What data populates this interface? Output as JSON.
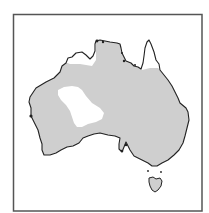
{
  "map": {
    "title": "",
    "region": "Australia",
    "description": "Distribution range map of Australia; shaded area indicates range, white areas are outside range",
    "colors": {
      "background": "#ffffff",
      "frame": "#555555",
      "coastline": "#222222",
      "range_fill": "#cfcfcf",
      "excluded_fill": "#ffffff"
    },
    "frame": {
      "x": 13.5,
      "y": 14.5,
      "width": 188.5,
      "height": 196.5
    },
    "legend": []
  }
}
